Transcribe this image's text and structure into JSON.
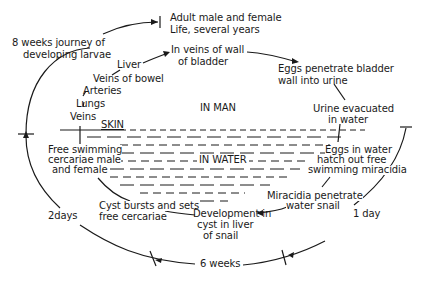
{
  "diagram": {
    "type": "life-cycle",
    "regions": {
      "in_man": "IN MAN",
      "in_water": "IN WATER",
      "skin": "SKIN"
    },
    "stages": {
      "adult": [
        "Adult male and female",
        "Life, several years"
      ],
      "veins_bladder": [
        "In veins of wall",
        "of bladder"
      ],
      "eggs_penetrate": [
        "Eggs penetrate bladder",
        "wall into urine"
      ],
      "urine": [
        "Urine evacuated",
        "in water"
      ],
      "eggs_water": [
        "Eggs in water",
        "hatch out free",
        "swimming miracidia"
      ],
      "miracidia": [
        "Miracidia penetrate",
        "water snail"
      ],
      "development": [
        "Development in",
        "cyst in liver",
        "of snail"
      ],
      "cyst_bursts": [
        "Cyst bursts and sets",
        "free cercariae"
      ],
      "cercariae": [
        "Free swimming",
        "cercariae male",
        "and female"
      ],
      "journey": [
        "8 weeks journey of",
        "developing larvae"
      ]
    },
    "larval_path": [
      "Veins",
      "Lungs",
      "Arteries",
      "Veins of bowel",
      "Liver"
    ],
    "durations": {
      "two_days": "2days",
      "six_weeks": "6 weeks",
      "one_day": "1 day"
    },
    "colors": {
      "ink": "#1a1a1a",
      "background": "#ffffff"
    }
  }
}
